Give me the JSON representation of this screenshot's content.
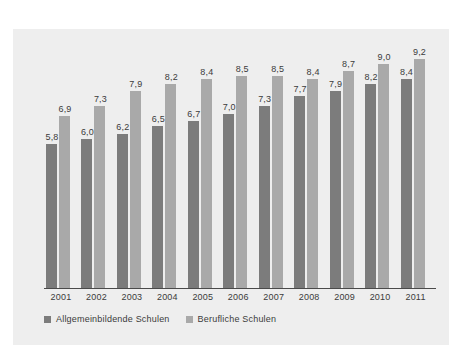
{
  "chart_data": {
    "type": "bar",
    "title": "",
    "subtitle": "",
    "xlabel": "",
    "ylabel": "",
    "categories": [
      "2001",
      "2002",
      "2003",
      "2004",
      "2005",
      "2006",
      "2007",
      "2008",
      "2009",
      "2010",
      "2011"
    ],
    "series": [
      {
        "name": "Allgemeinbildende Schulen",
        "color": "#7c7c7c",
        "values": [
          5.8,
          6.0,
          6.2,
          6.5,
          6.7,
          7.0,
          7.3,
          7.7,
          7.9,
          8.2,
          8.4
        ],
        "labels": [
          "5,8",
          "6,0",
          "6,2",
          "6,5",
          "6,7",
          "7,0",
          "7,3",
          "7,7",
          "7,9",
          "8,2",
          "8,4"
        ]
      },
      {
        "name": "Berufliche Schulen",
        "color": "#a9a9a9",
        "values": [
          6.9,
          7.3,
          7.9,
          8.2,
          8.4,
          8.5,
          8.5,
          8.4,
          8.7,
          9.0,
          9.2
        ],
        "labels": [
          "6,9",
          "7,3",
          "7,9",
          "8,2",
          "8,4",
          "8,5",
          "8,5",
          "8,4",
          "8,7",
          "9,0",
          "9,2"
        ]
      }
    ],
    "ylim": [
      0,
      10.2
    ],
    "grid": false,
    "legend_position": "bottom-left",
    "value_labels_shown": true,
    "decimal_separator": ","
  },
  "colors": {
    "page_background": "#ffffff",
    "panel_background": "#eeeeee",
    "axis_line": "#4a4a4a",
    "text": "#3b3b3b",
    "series_1": "#7c7c7c",
    "series_2": "#a9a9a9"
  }
}
